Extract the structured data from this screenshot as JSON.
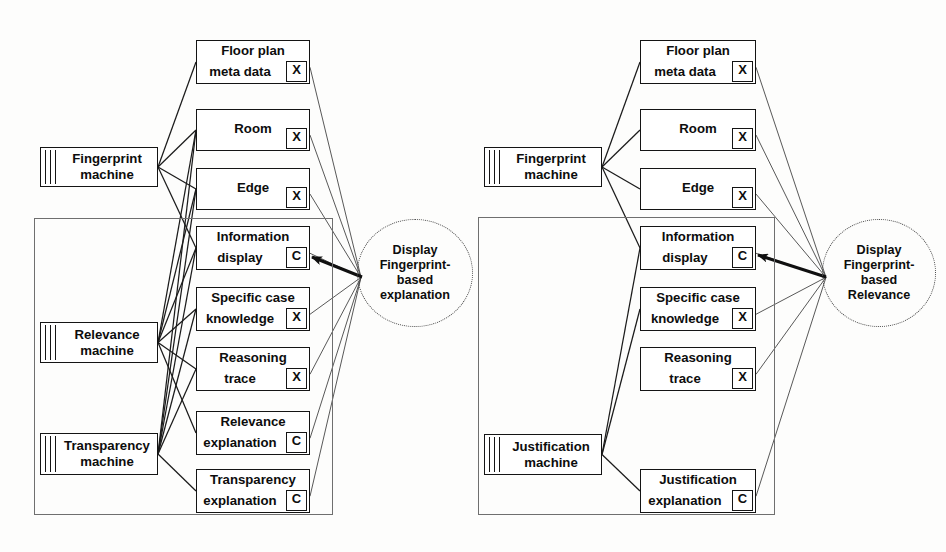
{
  "diagram": {
    "colors": {
      "stroke": "#141414",
      "frame": "#6f6f6f",
      "background": "#fdfdfc",
      "arrow": "#101010"
    }
  },
  "left_panel": {
    "machines": [
      {
        "id": "fingerprint-machine",
        "line1": "Fingerprint",
        "line2": "machine",
        "x": 40,
        "y": 147,
        "w": 118,
        "h": 40
      },
      {
        "id": "relevance-machine",
        "line1": "Relevance",
        "line2": "machine",
        "x": 40,
        "y": 322,
        "w": 118,
        "h": 41
      },
      {
        "id": "transparency-machine",
        "line1": "Transparency",
        "line2": "machine",
        "x": 40,
        "y": 433,
        "w": 118,
        "h": 42
      }
    ],
    "nodes": [
      {
        "id": "floor-plan-meta-data",
        "line1": "Floor plan",
        "line2": "meta data",
        "tag": "X",
        "x": 196,
        "y": 40,
        "w": 114,
        "h": 44
      },
      {
        "id": "room",
        "line1": "Room",
        "line2": "",
        "tag": "X",
        "x": 196,
        "y": 109,
        "w": 114,
        "h": 42,
        "single": true
      },
      {
        "id": "edge",
        "line1": "Edge",
        "line2": "",
        "tag": "X",
        "x": 196,
        "y": 168,
        "w": 114,
        "h": 42,
        "single": true
      },
      {
        "id": "information-display",
        "line1": "Information",
        "line2": "display",
        "tag": "C",
        "x": 196,
        "y": 226,
        "w": 114,
        "h": 44
      },
      {
        "id": "specific-case-knowledge",
        "line1": "Specific case",
        "line2": "knowledge",
        "tag": "X",
        "x": 196,
        "y": 287,
        "w": 114,
        "h": 44
      },
      {
        "id": "reasoning-trace",
        "line1": "Reasoning",
        "line2": "trace",
        "tag": "X",
        "x": 196,
        "y": 347,
        "w": 114,
        "h": 44
      },
      {
        "id": "relevance-explanation",
        "line1": "Relevance",
        "line2": "explanation",
        "tag": "C",
        "x": 196,
        "y": 411,
        "w": 114,
        "h": 44
      },
      {
        "id": "transparency-explanation",
        "line1": "Transparency",
        "line2": "explanation",
        "tag": "C",
        "x": 196,
        "y": 469,
        "w": 114,
        "h": 44
      }
    ],
    "frame": {
      "x": 34,
      "y": 218,
      "w": 299,
      "h": 297
    },
    "ellipse": {
      "id": "display-fingerprint-based-explanation",
      "lines": [
        "Display",
        "Fingerprint-",
        "based",
        "explanation"
      ],
      "x": 357,
      "y": 219,
      "w": 116,
      "h": 108
    },
    "arrow": {
      "from_x": 362,
      "from_y": 277,
      "to_x": 312,
      "to_y": 257
    }
  },
  "right_panel": {
    "machines": [
      {
        "id": "fingerprint-machine-2",
        "line1": "Fingerprint",
        "line2": "machine",
        "x": 484,
        "y": 147,
        "w": 118,
        "h": 40
      },
      {
        "id": "justification-machine",
        "line1": "Justification",
        "line2": "machine",
        "x": 484,
        "y": 434,
        "w": 118,
        "h": 41
      }
    ],
    "nodes": [
      {
        "id": "floor-plan-meta-data-2",
        "line1": "Floor plan",
        "line2": "meta data",
        "tag": "X",
        "x": 640,
        "y": 40,
        "w": 116,
        "h": 44
      },
      {
        "id": "room-2",
        "line1": "Room",
        "line2": "",
        "tag": "X",
        "x": 640,
        "y": 109,
        "w": 116,
        "h": 42,
        "single": true
      },
      {
        "id": "edge-2",
        "line1": "Edge",
        "line2": "",
        "tag": "X",
        "x": 640,
        "y": 168,
        "w": 116,
        "h": 42,
        "single": true
      },
      {
        "id": "information-display-2",
        "line1": "Information",
        "line2": "display",
        "tag": "C",
        "x": 640,
        "y": 226,
        "w": 116,
        "h": 44
      },
      {
        "id": "specific-case-knowledge-2",
        "line1": "Specific case",
        "line2": "knowledge",
        "tag": "X",
        "x": 640,
        "y": 287,
        "w": 116,
        "h": 44
      },
      {
        "id": "reasoning-trace-2",
        "line1": "Reasoning",
        "line2": "trace",
        "tag": "X",
        "x": 640,
        "y": 347,
        "w": 116,
        "h": 44
      },
      {
        "id": "justification-explanation",
        "line1": "Justification",
        "line2": "explanation",
        "tag": "C",
        "x": 640,
        "y": 469,
        "w": 116,
        "h": 44
      }
    ],
    "frame": {
      "x": 478,
      "y": 217,
      "w": 297,
      "h": 298
    },
    "ellipse": {
      "id": "display-fingerprint-based-relevance",
      "lines": [
        "Display",
        "Fingerprint-",
        "based",
        "Relevance"
      ],
      "x": 822,
      "y": 219,
      "w": 114,
      "h": 108
    },
    "arrow": {
      "from_x": 826,
      "from_y": 277,
      "to_x": 758,
      "to_y": 255
    }
  },
  "connections": {
    "left_machine_links": [
      {
        "from": "fingerprint-machine",
        "to": "floor-plan-meta-data"
      },
      {
        "from": "fingerprint-machine",
        "to": "room"
      },
      {
        "from": "fingerprint-machine",
        "to": "edge"
      },
      {
        "from": "fingerprint-machine",
        "to": "information-display"
      },
      {
        "from": "relevance-machine",
        "to": "room"
      },
      {
        "from": "relevance-machine",
        "to": "edge"
      },
      {
        "from": "relevance-machine",
        "to": "information-display"
      },
      {
        "from": "relevance-machine",
        "to": "specific-case-knowledge"
      },
      {
        "from": "relevance-machine",
        "to": "reasoning-trace"
      },
      {
        "from": "relevance-machine",
        "to": "relevance-explanation"
      },
      {
        "from": "transparency-machine",
        "to": "room"
      },
      {
        "from": "transparency-machine",
        "to": "edge"
      },
      {
        "from": "transparency-machine",
        "to": "information-display"
      },
      {
        "from": "transparency-machine",
        "to": "specific-case-knowledge"
      },
      {
        "from": "transparency-machine",
        "to": "reasoning-trace"
      },
      {
        "from": "transparency-machine",
        "to": "transparency-explanation"
      }
    ],
    "left_ellipse_links": [
      "floor-plan-meta-data",
      "room",
      "edge",
      "information-display",
      "specific-case-knowledge",
      "reasoning-trace",
      "relevance-explanation",
      "transparency-explanation"
    ],
    "right_machine_links": [
      {
        "from": "fingerprint-machine-2",
        "to": "floor-plan-meta-data-2"
      },
      {
        "from": "fingerprint-machine-2",
        "to": "room-2"
      },
      {
        "from": "fingerprint-machine-2",
        "to": "edge-2"
      },
      {
        "from": "fingerprint-machine-2",
        "to": "information-display-2"
      },
      {
        "from": "justification-machine",
        "to": "information-display-2"
      },
      {
        "from": "justification-machine",
        "to": "specific-case-knowledge-2"
      },
      {
        "from": "justification-machine",
        "to": "justification-explanation"
      }
    ],
    "right_ellipse_links": [
      "floor-plan-meta-data-2",
      "room-2",
      "edge-2",
      "information-display-2",
      "specific-case-knowledge-2",
      "reasoning-trace-2",
      "justification-explanation"
    ]
  }
}
